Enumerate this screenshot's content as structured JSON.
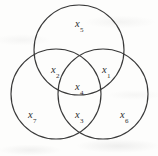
{
  "figure": {
    "type": "venn-diagram",
    "stroke_color": "#3a3a3a",
    "background_color": "#fdfdfc",
    "label_color": "#2e2e2e"
  },
  "circles": [
    {
      "name": "top-circle",
      "cx": 79,
      "cy": 50,
      "r": 45
    },
    {
      "name": "bottom-left-circle",
      "cx": 56,
      "cy": 94,
      "r": 45
    },
    {
      "name": "bottom-right-circle",
      "cx": 103,
      "cy": 94,
      "r": 45
    }
  ],
  "regions": [
    {
      "id": "x5",
      "base": "x",
      "sub": "5",
      "x": 79,
      "y": 23,
      "region": "top-circle-only"
    },
    {
      "id": "x2",
      "base": "x",
      "sub": "2",
      "x": 55,
      "y": 69,
      "region": "top-and-bottom-left"
    },
    {
      "id": "x1",
      "base": "x",
      "sub": "1",
      "x": 106,
      "y": 69,
      "region": "top-and-bottom-right"
    },
    {
      "id": "x4",
      "base": "x",
      "sub": "4",
      "x": 79,
      "y": 86,
      "region": "all-three"
    },
    {
      "id": "x3",
      "base": "x",
      "sub": "3",
      "x": 79,
      "y": 114,
      "region": "bottom-left-and-bottom-right"
    },
    {
      "id": "x7",
      "base": "x",
      "sub": "7",
      "x": 32,
      "y": 114,
      "region": "bottom-left-only"
    },
    {
      "id": "x6",
      "base": "x",
      "sub": "6",
      "x": 124,
      "y": 114,
      "region": "bottom-right-only"
    }
  ]
}
